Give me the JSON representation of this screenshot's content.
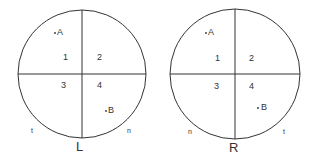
{
  "diagrams": [
    {
      "id": "left",
      "title": "L",
      "center": [
        82,
        74
      ],
      "radius": 64,
      "quadrants": [
        "1",
        "2",
        "3",
        "4"
      ],
      "points": [
        {
          "label": "A",
          "x": 55,
          "y": 31
        },
        {
          "label": "B",
          "x": 107,
          "y": 110
        }
      ],
      "side_labels": {
        "left": "t",
        "right": "n"
      }
    },
    {
      "id": "right",
      "title": "R",
      "center": [
        235,
        74
      ],
      "radius": 65,
      "quadrants": [
        "1",
        "2",
        "3",
        "4"
      ],
      "points": [
        {
          "label": "A",
          "x": 207,
          "y": 31
        },
        {
          "label": "B",
          "x": 258,
          "y": 107
        }
      ],
      "side_labels": {
        "left": "n",
        "right": "t"
      }
    }
  ],
  "colors": {
    "line": "#333333",
    "background": "#ffffff"
  }
}
